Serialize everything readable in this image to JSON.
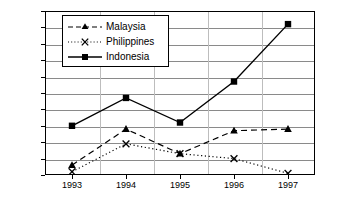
{
  "chart_data": {
    "type": "line",
    "title": "",
    "xlabel": "",
    "ylabel": "",
    "categories": [
      "1993",
      "1994",
      "1995",
      "1996",
      "1997"
    ],
    "x": [
      1993,
      1994,
      1995,
      1996,
      1997
    ],
    "ylim": [
      40,
      90
    ],
    "ytick_labels": [
      "90%",
      "85%",
      "80%",
      "75%",
      "70%",
      "65%",
      "60%",
      "55%",
      "50%",
      "45%",
      "40%"
    ],
    "ytick_values": [
      90,
      85,
      80,
      75,
      70,
      65,
      60,
      55,
      50,
      45,
      40
    ],
    "grid": true,
    "legend_position": "top-left-inside",
    "series": [
      {
        "name": "Malaysia",
        "values": [
          43,
          54,
          46.5,
          53.5,
          54
        ],
        "marker": "triangle",
        "line_style": "dashed",
        "color": "#000000"
      },
      {
        "name": "Philippines",
        "values": [
          41,
          49.5,
          46.5,
          45,
          40.5
        ],
        "marker": "x",
        "line_style": "dotted",
        "color": "#000000"
      },
      {
        "name": "Indonesia",
        "values": [
          55,
          63.5,
          56,
          68.5,
          86
        ],
        "marker": "square",
        "line_style": "solid",
        "color": "#000000"
      }
    ]
  },
  "axes": {
    "y_ticks": [
      {
        "label": "90%"
      },
      {
        "label": "85%"
      },
      {
        "label": "80%"
      },
      {
        "label": "75%"
      },
      {
        "label": "70%"
      },
      {
        "label": "65%"
      },
      {
        "label": "60%"
      },
      {
        "label": "55%"
      },
      {
        "label": "50%"
      },
      {
        "label": "45%"
      },
      {
        "label": "40%"
      }
    ],
    "x_ticks": [
      {
        "label": "1993"
      },
      {
        "label": "1994"
      },
      {
        "label": "1995"
      },
      {
        "label": "1996"
      },
      {
        "label": "1997"
      }
    ]
  },
  "legend": {
    "entries": [
      {
        "label": "Malaysia"
      },
      {
        "label": "Philippines"
      },
      {
        "label": "Indonesia"
      }
    ]
  }
}
